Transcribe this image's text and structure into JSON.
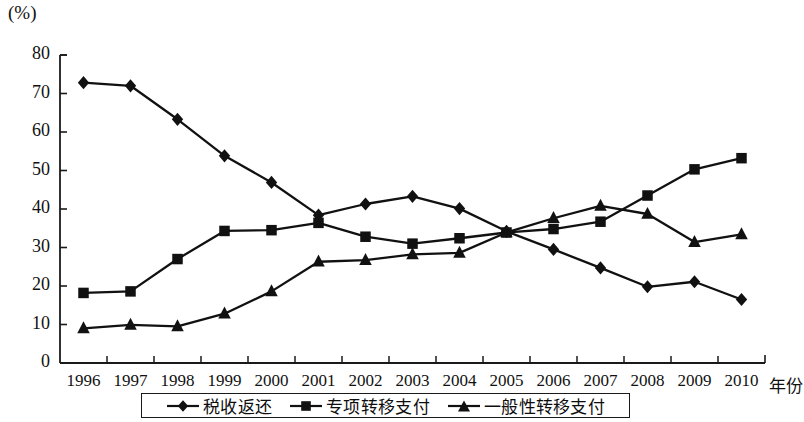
{
  "chart_data": {
    "type": "line",
    "title": "",
    "subtitle": "",
    "unit_label": "(%)",
    "xlabel": "年份",
    "ylabel": "",
    "categories": [
      "1996",
      "1997",
      "1998",
      "1999",
      "2000",
      "2001",
      "2002",
      "2003",
      "2004",
      "2005",
      "2006",
      "2007",
      "2008",
      "2009",
      "2010"
    ],
    "ylim": [
      0,
      80
    ],
    "yticks": [
      "0",
      "10",
      "20",
      "30",
      "40",
      "50",
      "60",
      "70",
      "80"
    ],
    "grid": false,
    "legend_position": "bottom",
    "series": [
      {
        "name": "税收返还",
        "marker": "diamond",
        "color": "#111111",
        "values": [
          72.8,
          72.0,
          63.3,
          53.8,
          46.9,
          38.4,
          41.3,
          43.3,
          40.1,
          34.2,
          29.5,
          24.7,
          19.8,
          21.1,
          16.5
        ]
      },
      {
        "name": "专项转移支付",
        "marker": "square",
        "color": "#111111",
        "values": [
          18.2,
          18.6,
          27.0,
          34.3,
          34.5,
          36.4,
          32.8,
          31.0,
          32.4,
          33.9,
          34.8,
          36.7,
          43.5,
          50.3,
          53.2
        ]
      },
      {
        "name": "一般性转移支付",
        "marker": "triangle",
        "color": "#111111",
        "values": [
          9.0,
          9.9,
          9.5,
          12.8,
          18.6,
          26.3,
          26.7,
          28.2,
          28.6,
          33.9,
          37.6,
          40.8,
          38.7,
          31.4,
          33.4
        ]
      }
    ]
  },
  "legend": {
    "items": [
      {
        "label": "税收返还",
        "marker": "diamond"
      },
      {
        "label": "专项转移支付",
        "marker": "square"
      },
      {
        "label": "一般性转移支付",
        "marker": "triangle"
      }
    ]
  }
}
